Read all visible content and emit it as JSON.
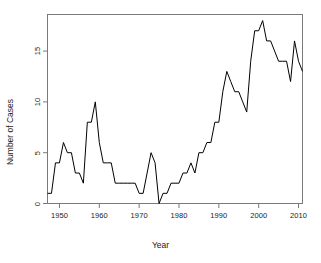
{
  "chart_data": {
    "type": "line",
    "title": "",
    "xlabel": "Year",
    "ylabel": "Number of Cases",
    "xlim": [
      1947,
      2011
    ],
    "ylim": [
      0,
      18.6
    ],
    "grid": false,
    "legend": null,
    "line_color": "#000000",
    "x_ticks": [
      1950,
      1960,
      1970,
      1980,
      1990,
      2000,
      2010
    ],
    "y_ticks": [
      0,
      5,
      10,
      15
    ],
    "x_tick_labels": [
      "1950",
      "1960",
      "1970",
      "1980",
      "1990",
      "2000",
      "2010"
    ],
    "y_tick_labels": [
      "0",
      "5",
      "10",
      "15"
    ],
    "series": [
      {
        "name": "Number of Cases",
        "x": [
          1947,
          1948,
          1949,
          1950,
          1951,
          1952,
          1953,
          1954,
          1955,
          1956,
          1957,
          1958,
          1959,
          1960,
          1961,
          1962,
          1963,
          1964,
          1965,
          1966,
          1967,
          1968,
          1969,
          1970,
          1971,
          1972,
          1973,
          1974,
          1975,
          1976,
          1977,
          1978,
          1979,
          1980,
          1981,
          1982,
          1983,
          1984,
          1985,
          1986,
          1987,
          1988,
          1989,
          1990,
          1991,
          1992,
          1993,
          1994,
          1995,
          1996,
          1997,
          1998,
          1999,
          2000,
          2001,
          2002,
          2003,
          2004,
          2005,
          2006,
          2007,
          2008,
          2009,
          2010,
          2011
        ],
        "values": [
          1,
          1,
          4,
          4,
          6,
          5,
          5,
          3,
          3,
          2,
          8,
          8,
          10,
          6,
          4,
          4,
          4,
          2,
          2,
          2,
          2,
          2,
          2,
          1,
          1,
          3,
          5,
          4,
          0,
          1,
          1,
          2,
          2,
          2,
          3,
          3,
          4,
          3,
          5,
          5,
          6,
          6,
          8,
          8,
          11,
          13,
          12,
          11,
          11,
          10,
          9,
          14,
          17,
          17,
          18,
          16,
          16,
          15,
          14,
          14,
          14,
          12,
          16,
          14,
          13
        ]
      }
    ]
  },
  "axes": {
    "x_title": "Year",
    "y_title": "Number of Cases"
  }
}
